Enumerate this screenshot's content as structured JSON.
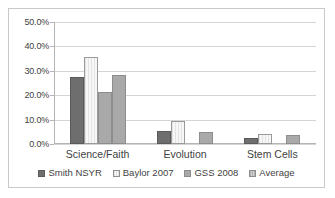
{
  "chart_data": {
    "type": "bar",
    "title": "",
    "xlabel": "",
    "ylabel": "",
    "categories": [
      "Science/Faith",
      "Evolution",
      "Stem Cells"
    ],
    "series": [
      {
        "name": "Smith NSYR",
        "values": [
          27.5,
          5.3,
          2.6
        ],
        "color": "#6e6e6e"
      },
      {
        "name": "Baylor 2007",
        "values": [
          35.8,
          9.5,
          4.2
        ],
        "color": "#ebebeb"
      },
      {
        "name": "GSS 2008",
        "values": [
          21.5,
          0.0,
          0.0
        ],
        "color": "#a9a9a9"
      },
      {
        "name": "Average",
        "values": [
          28.4,
          5.0,
          3.6
        ],
        "color": "#a9a9a9"
      }
    ],
    "ylim": [
      0,
      50
    ],
    "yticks": [
      50,
      40,
      30,
      20,
      10,
      0
    ],
    "ytick_labels": [
      "50.0%",
      "40.0%",
      "30.0%",
      "20.0%",
      "10.0%",
      "0.0%"
    ],
    "grid": true,
    "legend_position": "bottom"
  },
  "legend": {
    "items": [
      {
        "label": "Smith NSYR"
      },
      {
        "label": "Baylor 2007"
      },
      {
        "label": "GSS 2008"
      },
      {
        "label": "Average"
      }
    ]
  }
}
